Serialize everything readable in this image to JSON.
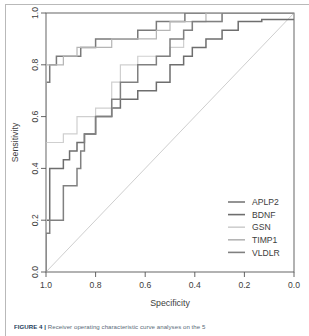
{
  "figure": {
    "caption_label": "FIGURE 4 |",
    "caption_text": " Receiver operating characteristic curve analyses on the 5"
  },
  "chart_data": {
    "type": "line",
    "title": "",
    "subtitle": "",
    "xlabel": "Specificity",
    "ylabel": "Sensitivity",
    "xlim": [
      1.0,
      0.0
    ],
    "ylim": [
      0.0,
      1.0
    ],
    "x_reversed": true,
    "grid": false,
    "legend_position": "bottom-right",
    "xticks": [
      "1.0",
      "0.8",
      "0.6",
      "0.4",
      "0.2",
      "0.0"
    ],
    "xtick_values": [
      1.0,
      0.8,
      0.6,
      0.4,
      0.2,
      0.0
    ],
    "yticks": [
      "0.0",
      "0.2",
      "0.4",
      "0.6",
      "0.8",
      "1.0"
    ],
    "ytick_values": [
      0.0,
      0.2,
      0.4,
      0.6,
      0.8,
      1.0
    ],
    "diagonal_reference": true,
    "diagonal_color": "#c8c8c8",
    "series": [
      {
        "name": "APLP2",
        "color": "#7a7a7a",
        "width": 1.5,
        "points": [
          [
            1.0,
            0.0
          ],
          [
            1.0,
            0.733
          ],
          [
            0.985,
            0.733
          ],
          [
            0.985,
            0.8
          ],
          [
            0.958,
            0.8
          ],
          [
            0.958,
            0.833
          ],
          [
            0.86,
            0.833
          ],
          [
            0.86,
            0.867
          ],
          [
            0.8,
            0.867
          ],
          [
            0.8,
            0.9
          ],
          [
            0.63,
            0.9
          ],
          [
            0.63,
            0.933
          ],
          [
            0.555,
            0.933
          ],
          [
            0.555,
            0.967
          ],
          [
            0.44,
            0.967
          ],
          [
            0.44,
            1.0
          ],
          [
            0.0,
            1.0
          ]
        ]
      },
      {
        "name": "BDNF",
        "color": "#6e6e6e",
        "width": 1.5,
        "points": [
          [
            1.0,
            0.0
          ],
          [
            1.0,
            0.2
          ],
          [
            0.985,
            0.2
          ],
          [
            0.985,
            0.4
          ],
          [
            0.93,
            0.4
          ],
          [
            0.93,
            0.433
          ],
          [
            0.905,
            0.433
          ],
          [
            0.905,
            0.467
          ],
          [
            0.875,
            0.467
          ],
          [
            0.875,
            0.5
          ],
          [
            0.845,
            0.5
          ],
          [
            0.845,
            0.533
          ],
          [
            0.8,
            0.533
          ],
          [
            0.8,
            0.6
          ],
          [
            0.735,
            0.6
          ],
          [
            0.735,
            0.633
          ],
          [
            0.7,
            0.633
          ],
          [
            0.7,
            0.667
          ],
          [
            0.63,
            0.667
          ],
          [
            0.63,
            0.7
          ],
          [
            0.555,
            0.7
          ],
          [
            0.555,
            0.733
          ],
          [
            0.5,
            0.733
          ],
          [
            0.5,
            0.8
          ],
          [
            0.445,
            0.8
          ],
          [
            0.445,
            0.833
          ],
          [
            0.41,
            0.833
          ],
          [
            0.41,
            0.867
          ],
          [
            0.355,
            0.867
          ],
          [
            0.355,
            0.9
          ],
          [
            0.29,
            0.9
          ],
          [
            0.29,
            0.933
          ],
          [
            0.225,
            0.933
          ],
          [
            0.225,
            0.967
          ],
          [
            0.13,
            0.967
          ],
          [
            0.13,
            0.975
          ],
          [
            0.0,
            0.975
          ]
        ]
      },
      {
        "name": "GSN",
        "color": "#cfcfcf",
        "width": 1.2,
        "points": [
          [
            1.0,
            0.0
          ],
          [
            1.0,
            0.5
          ],
          [
            0.93,
            0.5
          ],
          [
            0.93,
            0.533
          ],
          [
            0.875,
            0.533
          ],
          [
            0.875,
            0.6
          ],
          [
            0.8,
            0.6
          ],
          [
            0.8,
            0.633
          ],
          [
            0.735,
            0.633
          ],
          [
            0.735,
            0.733
          ],
          [
            0.7,
            0.733
          ],
          [
            0.7,
            0.8
          ],
          [
            0.63,
            0.8
          ],
          [
            0.63,
            0.833
          ],
          [
            0.5,
            0.833
          ],
          [
            0.5,
            0.867
          ],
          [
            0.445,
            0.867
          ],
          [
            0.445,
            0.933
          ],
          [
            0.41,
            0.933
          ],
          [
            0.41,
            0.967
          ],
          [
            0.29,
            0.967
          ],
          [
            0.29,
            1.0
          ],
          [
            0.0,
            1.0
          ]
        ]
      },
      {
        "name": "TIMP1",
        "color": "#b5b5b5",
        "width": 1.2,
        "points": [
          [
            1.0,
            0.0
          ],
          [
            1.0,
            0.8
          ],
          [
            0.93,
            0.8
          ],
          [
            0.93,
            0.833
          ],
          [
            0.875,
            0.833
          ],
          [
            0.875,
            0.867
          ],
          [
            0.735,
            0.867
          ],
          [
            0.735,
            0.9
          ],
          [
            0.555,
            0.9
          ],
          [
            0.555,
            0.933
          ],
          [
            0.5,
            0.933
          ],
          [
            0.5,
            0.967
          ],
          [
            0.355,
            0.967
          ],
          [
            0.355,
            1.0
          ],
          [
            0.0,
            1.0
          ]
        ]
      },
      {
        "name": "VLDLR",
        "color": "#808080",
        "width": 1.5,
        "points": [
          [
            1.0,
            0.0
          ],
          [
            1.0,
            0.15
          ],
          [
            0.985,
            0.15
          ],
          [
            0.985,
            0.2
          ],
          [
            0.93,
            0.2
          ],
          [
            0.93,
            0.333
          ],
          [
            0.875,
            0.333
          ],
          [
            0.875,
            0.4
          ],
          [
            0.86,
            0.4
          ],
          [
            0.86,
            0.467
          ],
          [
            0.845,
            0.467
          ],
          [
            0.845,
            0.533
          ],
          [
            0.8,
            0.533
          ],
          [
            0.8,
            0.6
          ],
          [
            0.735,
            0.6
          ],
          [
            0.735,
            0.667
          ],
          [
            0.7,
            0.667
          ],
          [
            0.7,
            0.733
          ],
          [
            0.63,
            0.733
          ],
          [
            0.63,
            0.8
          ],
          [
            0.555,
            0.8
          ],
          [
            0.555,
            0.833
          ],
          [
            0.5,
            0.833
          ],
          [
            0.5,
            0.9
          ],
          [
            0.445,
            0.9
          ],
          [
            0.445,
            0.933
          ],
          [
            0.41,
            0.933
          ],
          [
            0.41,
            0.967
          ],
          [
            0.29,
            0.967
          ],
          [
            0.29,
            1.0
          ],
          [
            0.0,
            1.0
          ]
        ]
      }
    ],
    "legend": [
      {
        "label": "APLP2",
        "color": "#7a7a7a"
      },
      {
        "label": "BDNF",
        "color": "#6e6e6e"
      },
      {
        "label": "GSN",
        "color": "#cfcfcf"
      },
      {
        "label": "TIMP1",
        "color": "#b5b5b5"
      },
      {
        "label": "VLDLR",
        "color": "#808080"
      }
    ]
  }
}
